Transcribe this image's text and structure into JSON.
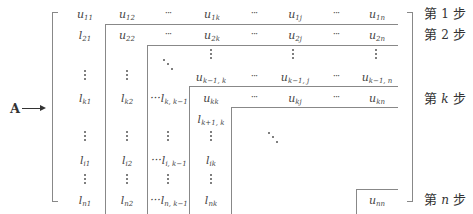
{
  "matrix_label": "A",
  "rows": {
    "r1": [
      "u11",
      "u12",
      "…",
      "u1k",
      "…",
      "u1j",
      "…",
      "u1n"
    ],
    "r2": [
      "l21",
      "u22",
      "…",
      "u2k",
      "…",
      "u2j",
      "…",
      "u2n"
    ],
    "rk_1": [
      "u_{k-1,k}",
      "…",
      "u_{k-1,j}",
      "…",
      "u_{k-1,n}"
    ],
    "rk": [
      "l_{k1}",
      "l_{k2}",
      "…l_{k,k-1}",
      "u_{kk}",
      "…",
      "u_{kj}",
      "…",
      "u_{kn}"
    ],
    "rk1": [
      "l_{k+1,k}"
    ],
    "ri": [
      "l_{i1}",
      "l_{i2}",
      "…l_{i,k-1}",
      "l_{ik}"
    ],
    "rn": [
      "l_{n1}",
      "l_{n2}",
      "…l_{n,k-1}",
      "l_{nk}",
      "u_{nn}"
    ]
  },
  "labels": {
    "A": "A",
    "c_u11_b": "u",
    "c_u11_s": "11",
    "c_u12_b": "u",
    "c_u12_s": "12",
    "c_u1k_b": "u",
    "c_u1k_s": "1k",
    "c_u1j_b": "u",
    "c_u1j_s": "1j",
    "c_u1n_b": "u",
    "c_u1n_s": "1n",
    "c_l21_b": "l",
    "c_l21_s": "21",
    "c_u22_b": "u",
    "c_u22_s": "22",
    "c_u2k_b": "u",
    "c_u2k_s": "2k",
    "c_u2j_b": "u",
    "c_u2j_s": "2j",
    "c_u2n_b": "u",
    "c_u2n_s": "2n",
    "c_uk1k_b": "u",
    "c_uk1k_s": "k−1, k",
    "c_uk1j_b": "u",
    "c_uk1j_s": "k−1, j",
    "c_uk1n_b": "u",
    "c_uk1n_s": "k−1, n",
    "c_lk1_b": "l",
    "c_lk1_s": "k1",
    "c_lk2_b": "l",
    "c_lk2_s": "k2",
    "c_lkk1_b": "···l",
    "c_lkk1_s": "k, k−1",
    "c_ukk_b": "u",
    "c_ukk_s": "kk",
    "c_ukj_b": "u",
    "c_ukj_s": "kj",
    "c_ukn_b": "u",
    "c_ukn_s": "kn",
    "c_lk1k_b": "l",
    "c_lk1k_s": "k+1, k",
    "c_li1_b": "l",
    "c_li1_s": "i1",
    "c_li2_b": "l",
    "c_li2_s": "i2",
    "c_lik1_b": "···l",
    "c_lik1_s": "i, k−1",
    "c_lik_b": "l",
    "c_lik_s": "ik",
    "c_ln1_b": "l",
    "c_ln1_s": "n1",
    "c_ln2_b": "l",
    "c_ln2_s": "n2",
    "c_lnk1_b": "···l",
    "c_lnk1_s": "n, k−1",
    "c_lnk_b": "l",
    "c_lnk_s": "nk",
    "c_unn_b": "u",
    "c_unn_s": "nn",
    "hdots": "···"
  },
  "steps": [
    {
      "pre": "第 ",
      "var": "1",
      "post": " 步"
    },
    {
      "pre": "第 ",
      "var": "2",
      "post": " 步"
    },
    {
      "pre": "第 ",
      "var": "k",
      "post": " 步"
    },
    {
      "pre": "第 ",
      "var": "n",
      "post": " 步"
    }
  ]
}
